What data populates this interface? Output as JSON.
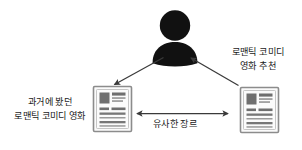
{
  "diagram": {
    "title_visible": false,
    "background_color": "#ffffff",
    "stroke_color": "#3a3a3a",
    "silhouette_color": "#111111",
    "document_border_color": "#8c8c8c",
    "document_fill_color": "#fbfbfb",
    "document_block_dark": "#6f6f6f",
    "document_line_color": "#777777",
    "nodes": [
      {
        "id": "user",
        "name": "user-silhouette",
        "icon": "person-icon",
        "label": ""
      },
      {
        "id": "watched-movie",
        "name": "document-watched",
        "icon": "document-icon",
        "label_lines": [
          "과거에 봤던",
          "로맨틱 코미디 영화"
        ]
      },
      {
        "id": "recommended-movie",
        "name": "document-recommended",
        "icon": "document-icon",
        "label_lines": [
          "로맨틱 코미디",
          "영화 추천"
        ]
      }
    ],
    "edges": [
      {
        "id": "user-to-watched",
        "name": "arrow-user-to-watched",
        "from": "user",
        "to": "watched-movie",
        "direction": "one-way",
        "label": ""
      },
      {
        "id": "recommended-to-user",
        "name": "arrow-recommended-to-user",
        "from": "recommended-movie",
        "to": "user",
        "direction": "one-way",
        "label_lines": [
          "로맨틱 코미디",
          "영화 추천"
        ]
      },
      {
        "id": "watched-to-recommended",
        "name": "arrow-similar-genre",
        "from": "watched-movie",
        "to": "recommended-movie",
        "direction": "two-way",
        "label": "유사한 장르"
      }
    ],
    "labels": {
      "left_line1": "과거에 봤던",
      "left_line2": "로맨틱 코미디 영화",
      "right_line1": "로맨틱 코미디",
      "right_line2": "영화 추천",
      "bottom": "유사한 장르"
    }
  }
}
